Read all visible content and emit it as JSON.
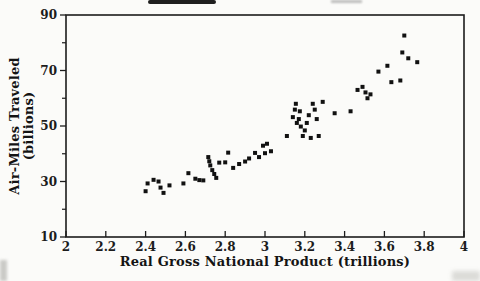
{
  "figure": {
    "y_axis_label_line1": "Air-Miles Traveled",
    "y_axis_label_line2": "(billions)",
    "x_axis_label": "Real Gross National Product (trillions)"
  },
  "colors": {
    "background": "#fbfbf9",
    "axis": "#1c1c1c",
    "marker": "#111111",
    "text": "#141414"
  },
  "chart_data": {
    "type": "scatter",
    "title": "",
    "xlabel": "Real Gross National Product (trillions)",
    "ylabel": "Air-Miles Traveled (billions)",
    "xlim": [
      2,
      4
    ],
    "ylim": [
      10,
      90
    ],
    "grid": false,
    "legend": "none",
    "x_ticks": {
      "values": [
        2,
        2.2,
        2.4,
        2.6,
        2.8,
        3,
        3.2,
        3.4,
        3.6,
        3.8,
        4
      ],
      "labels": [
        "2",
        "2.2",
        "2.4",
        "2.6",
        "2.8",
        "3",
        "3.2",
        "3.4",
        "3.6",
        "3.8",
        "4"
      ]
    },
    "y_ticks": {
      "major_values": [
        10,
        30,
        50,
        70,
        90
      ],
      "major_labels": [
        "10",
        "30",
        "50",
        "70",
        "90"
      ],
      "minor_values": [
        20,
        40,
        60,
        80
      ]
    },
    "marker": {
      "shape": "square",
      "size_px": 4,
      "color": "#111111"
    },
    "points": [
      [
        2.4,
        26.5
      ],
      [
        2.41,
        29.3
      ],
      [
        2.44,
        30.6
      ],
      [
        2.465,
        30.0
      ],
      [
        2.475,
        27.8
      ],
      [
        2.49,
        25.9
      ],
      [
        2.52,
        28.6
      ],
      [
        2.59,
        29.3
      ],
      [
        2.615,
        33.0
      ],
      [
        2.65,
        31.0
      ],
      [
        2.67,
        30.5
      ],
      [
        2.69,
        30.4
      ],
      [
        2.715,
        38.8
      ],
      [
        2.72,
        37.3
      ],
      [
        2.725,
        35.8
      ],
      [
        2.735,
        34.1
      ],
      [
        2.745,
        32.7
      ],
      [
        2.755,
        31.3
      ],
      [
        2.77,
        36.8
      ],
      [
        2.8,
        36.9
      ],
      [
        2.815,
        40.4
      ],
      [
        2.84,
        34.9
      ],
      [
        2.87,
        36.3
      ],
      [
        2.9,
        37.2
      ],
      [
        2.92,
        38.3
      ],
      [
        2.95,
        40.3
      ],
      [
        2.97,
        38.8
      ],
      [
        2.99,
        42.9
      ],
      [
        3.0,
        40.2
      ],
      [
        3.01,
        43.6
      ],
      [
        3.03,
        40.9
      ],
      [
        3.11,
        46.4
      ],
      [
        3.14,
        53.2
      ],
      [
        3.15,
        55.9
      ],
      [
        3.155,
        58.0
      ],
      [
        3.16,
        51.1
      ],
      [
        3.17,
        52.5
      ],
      [
        3.175,
        55.3
      ],
      [
        3.18,
        49.8
      ],
      [
        3.19,
        46.4
      ],
      [
        3.2,
        48.4
      ],
      [
        3.21,
        51.1
      ],
      [
        3.22,
        53.9
      ],
      [
        3.23,
        45.7
      ],
      [
        3.24,
        58.0
      ],
      [
        3.25,
        55.9
      ],
      [
        3.26,
        52.5
      ],
      [
        3.27,
        46.4
      ],
      [
        3.29,
        58.7
      ],
      [
        3.35,
        54.6
      ],
      [
        3.43,
        55.3
      ],
      [
        3.465,
        63.0
      ],
      [
        3.49,
        64.1
      ],
      [
        3.505,
        62.1
      ],
      [
        3.515,
        60.0
      ],
      [
        3.53,
        61.4
      ],
      [
        3.57,
        69.6
      ],
      [
        3.615,
        71.7
      ],
      [
        3.635,
        65.8
      ],
      [
        3.68,
        66.4
      ],
      [
        3.69,
        76.5
      ],
      [
        3.7,
        82.6
      ],
      [
        3.72,
        74.4
      ],
      [
        3.765,
        73.0
      ]
    ],
    "layout": {
      "plot_left": 66,
      "plot_top": 15,
      "plot_right": 464,
      "plot_bottom": 237,
      "tick_len": 6,
      "minor_tick_len": 4,
      "x_tick_label_offset": 14,
      "y_tick_label_offset": 9
    }
  }
}
